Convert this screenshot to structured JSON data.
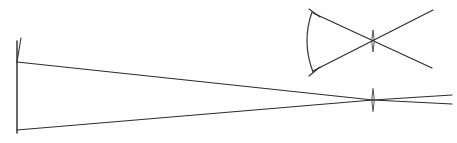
{
  "figure": {
    "type": "line-diagram",
    "width": 457,
    "height": 143,
    "background_color": "#ffffff",
    "ink_color": "#2b2b31",
    "lens_color": "#4a4a52"
  },
  "chart_data": {
    "type": "line",
    "xlabel": "",
    "ylabel": "",
    "xlim": [
      0,
      457
    ],
    "ylim": [
      0,
      143
    ],
    "grid": false,
    "legend": "none",
    "note": "Two ray bundles converging on thin lenses; coordinates in pixel space, y increases downward",
    "series": [
      {
        "name": "object-vertical-line",
        "kind": "segment",
        "points": [
          [
            17,
            41
          ],
          [
            17,
            133
          ]
        ]
      },
      {
        "name": "object-top-tick",
        "kind": "segment",
        "points": [
          [
            17,
            62
          ],
          [
            21,
            38
          ]
        ]
      },
      {
        "name": "main-upper-ray",
        "kind": "segment",
        "points": [
          [
            17,
            62
          ],
          [
            373,
            100
          ]
        ]
      },
      {
        "name": "main-lower-ray",
        "kind": "segment",
        "points": [
          [
            17,
            130
          ],
          [
            373,
            100
          ]
        ]
      },
      {
        "name": "main-exit-ray-upper",
        "kind": "segment",
        "points": [
          [
            373,
            100
          ],
          [
            452,
            95
          ]
        ]
      },
      {
        "name": "main-exit-ray-lower",
        "kind": "segment",
        "points": [
          [
            373,
            100
          ],
          [
            452,
            104
          ]
        ]
      },
      {
        "name": "inset-arc-object",
        "kind": "arc",
        "points": [
          [
            312,
            12
          ],
          [
            307,
            42
          ],
          [
            313,
            72
          ]
        ]
      },
      {
        "name": "inset-ray-down",
        "kind": "segment",
        "points": [
          [
            313,
            13
          ],
          [
            432,
            68
          ]
        ]
      },
      {
        "name": "inset-ray-up",
        "kind": "segment",
        "points": [
          [
            313,
            71
          ],
          [
            433,
            10
          ]
        ]
      },
      {
        "name": "inset-tick-top",
        "kind": "segment",
        "points": [
          [
            309,
            9
          ],
          [
            320,
            17
          ]
        ]
      },
      {
        "name": "inset-tick-bottom",
        "kind": "segment",
        "points": [
          [
            309,
            76
          ],
          [
            320,
            67
          ]
        ]
      }
    ],
    "lenses": [
      {
        "name": "main-lens",
        "center": [
          373,
          100
        ],
        "half_width": 2.6,
        "half_height": 11.5
      },
      {
        "name": "inset-lens",
        "center": [
          373,
          41
        ],
        "half_width": 2.6,
        "half_height": 11.0
      }
    ]
  }
}
